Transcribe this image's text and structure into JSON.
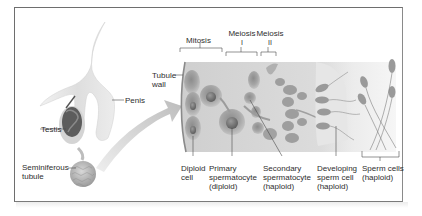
{
  "diagram": {
    "anatomy_labels": {
      "penis": "Penis",
      "testis": "Testis",
      "seminiferous_tubule_line1": "Seminiferous",
      "seminiferous_tubule_line2": "tubule"
    },
    "stage_headers": {
      "mitosis": "Mitosis",
      "meiosis1_line1": "Meiosis",
      "meiosis1_line2": "I",
      "meiosis2_line1": "Meiosis",
      "meiosis2_line2": "II"
    },
    "tubule_wall": {
      "line1": "Tubule",
      "line2": "wall"
    },
    "cell_labels": [
      {
        "line1": "Diploid",
        "line2": "cell",
        "line3": ""
      },
      {
        "line1": "Primary",
        "line2": "spermatocyte",
        "line3": "(diploid)"
      },
      {
        "line1": "Secondary",
        "line2": "spermatocyte",
        "line3": "(haploid)"
      },
      {
        "line1": "Developing",
        "line2": "sperm cell",
        "line3": "(haploid)"
      },
      {
        "line1": "Sperm cells",
        "line2": "(haploid)",
        "line3": ""
      }
    ],
    "colors": {
      "frame": "#6e6e6e",
      "tissue_band": "#d9d9d9",
      "cell_fill": "#9a9a9a",
      "cell_dark": "#6f6f6f",
      "organ_light": "#e2e2e2",
      "testis_dark": "#5c5c5c",
      "arrow": "#c8c8c8",
      "text": "#2e2e2e"
    }
  }
}
